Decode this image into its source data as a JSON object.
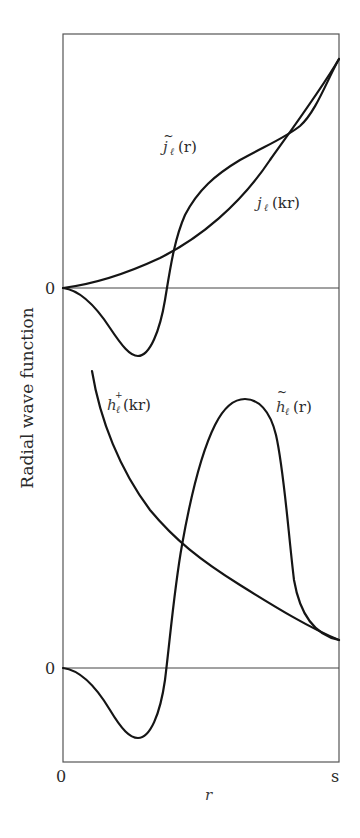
{
  "figure": {
    "ylabel": "Radial wave function",
    "xlabel": "r",
    "x_ticks": {
      "start": "0",
      "end": "s"
    },
    "upper_panel": {
      "zero_label": "0",
      "curves": [
        {
          "id": "j_tilde",
          "label_base": "j",
          "label_sub": "ℓ",
          "label_arg": "(r)",
          "tilde": true,
          "full_label": "j̃ℓ(r)"
        },
        {
          "id": "j_free",
          "label_base": "j",
          "label_sub": "ℓ",
          "label_arg": "(kr)",
          "tilde": false,
          "full_label": "jℓ(kr)"
        }
      ]
    },
    "lower_panel": {
      "zero_label": "0",
      "curves": [
        {
          "id": "h_plus",
          "label_base": "h",
          "label_sub": "ℓ",
          "label_sup": "+",
          "label_arg": "(kr)",
          "full_label": "h⁺ℓ(kr)"
        },
        {
          "id": "h_tilde",
          "label_base": "h",
          "label_sub": "ℓ",
          "label_arg": "(r)",
          "tilde": true,
          "full_label": "h̃ℓ(r)"
        }
      ]
    },
    "colors": {
      "curve": "#151515",
      "frame": "#555555",
      "text": "#2a2a2a"
    }
  }
}
